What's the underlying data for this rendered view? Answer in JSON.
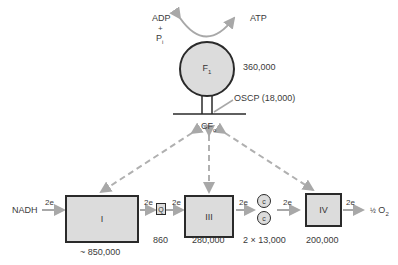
{
  "substrates": {
    "adp": "ADP",
    "plus": "+",
    "pi": "P",
    "pi_sub": "i",
    "atp": "ATP",
    "nadh": "NADH",
    "half": "½",
    "o2": "O",
    "o2_sub": "2"
  },
  "f1": {
    "label": "F",
    "sub": "1",
    "mass": "360,000"
  },
  "oscp": {
    "label": "OSCP (18,000)"
  },
  "cf0": {
    "label": "CF",
    "sub": "o"
  },
  "complexes": [
    {
      "id": "I",
      "label": "I",
      "mass": "~  850,000"
    },
    {
      "id": "Q",
      "label": "Q",
      "mass": "860"
    },
    {
      "id": "III",
      "label": "III",
      "mass": "280,000"
    },
    {
      "id": "c",
      "label": "c",
      "mass": "2 × 13,000"
    },
    {
      "id": "IV",
      "label": "IV",
      "mass": "200,000"
    }
  ],
  "electron_labels": [
    "2e",
    "2e",
    "2e",
    "2e",
    "2e",
    "2e"
  ],
  "colors": {
    "fill": "#dcdcdc",
    "stroke": "#2a2a2a",
    "arrow": "#a8a8a8"
  }
}
